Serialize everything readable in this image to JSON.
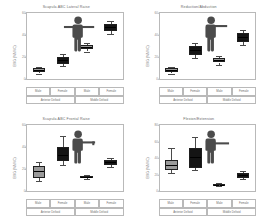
{
  "figure": {
    "background": "#ffffff",
    "box_fill_male": "#9a9a9a",
    "box_fill_female": "#141414",
    "axis_color": "#b9b9b9"
  },
  "panels": [
    {
      "id": "panel-scapula-lateral-raise",
      "title": "Scapula ABC Lateral Raise",
      "figure_icon": "standing-figure-arm-lateral-icon",
      "chart_data": {
        "type": "bar",
        "subtype": "boxplot",
        "title": "Scapula ABC Lateral Raise",
        "xlabel": "",
        "ylabel": "EMG (%MVC)",
        "ylim": [
          0,
          60
        ],
        "yticks": [
          0,
          20,
          40,
          60
        ],
        "ytick_labels": [
          "0",
          "20",
          "40",
          "60"
        ],
        "grid": false,
        "legend": "none",
        "categories": [
          "Male",
          "Female",
          "Male",
          "Female"
        ],
        "groups": [
          "Anterior Deltoid",
          "Middle Deltoid"
        ],
        "series": [
          {
            "name": "boxes",
            "boxes": [
              {
                "label": "Male",
                "group": "Anterior Deltoid",
                "q1": 6,
                "median": 8,
                "q3": 10,
                "whisker_low": 5,
                "whisker_high": 11,
                "fill": "#9a9a9a"
              },
              {
                "label": "Female",
                "group": "Anterior Deltoid",
                "q1": 14,
                "median": 17,
                "q3": 20,
                "whisker_low": 12,
                "whisker_high": 23,
                "fill": "#141414"
              },
              {
                "label": "Male",
                "group": "Middle Deltoid",
                "q1": 27,
                "median": 29,
                "q3": 31,
                "whisker_low": 25,
                "whisker_high": 33,
                "fill": "#9a9a9a"
              },
              {
                "label": "Female",
                "group": "Middle Deltoid",
                "q1": 44,
                "median": 47,
                "q3": 50,
                "whisker_low": 41,
                "whisker_high": 53,
                "fill": "#141414"
              }
            ]
          }
        ]
      }
    },
    {
      "id": "panel-reduction-abduction",
      "title": "Reduction/Abduction",
      "figure_icon": "standing-figure-arm-abduction-icon",
      "chart_data": {
        "type": "bar",
        "subtype": "boxplot",
        "title": "Reduction/Abduction",
        "xlabel": "",
        "ylabel": "EMG (%MVC)",
        "ylim": [
          0,
          60
        ],
        "yticks": [
          0,
          20,
          40,
          60
        ],
        "ytick_labels": [
          "0",
          "20",
          "40",
          "60"
        ],
        "grid": false,
        "legend": "none",
        "categories": [
          "Male",
          "Female",
          "Male",
          "Female"
        ],
        "groups": [
          "Anterior Deltoid",
          "Middle Deltoid"
        ],
        "series": [
          {
            "name": "boxes",
            "boxes": [
              {
                "label": "Male",
                "group": "Anterior Deltoid",
                "q1": 6,
                "median": 8,
                "q3": 10,
                "whisker_low": 5,
                "whisker_high": 11,
                "fill": "#9a9a9a"
              },
              {
                "label": "Female",
                "group": "Anterior Deltoid",
                "q1": 22,
                "median": 26,
                "q3": 30,
                "whisker_low": 19,
                "whisker_high": 33,
                "fill": "#141414"
              },
              {
                "label": "Male",
                "group": "Middle Deltoid",
                "q1": 15,
                "median": 17,
                "q3": 19,
                "whisker_low": 13,
                "whisker_high": 21,
                "fill": "#9a9a9a"
              },
              {
                "label": "Female",
                "group": "Middle Deltoid",
                "q1": 34,
                "median": 38,
                "q3": 42,
                "whisker_low": 31,
                "whisker_high": 45,
                "fill": "#141414"
              }
            ]
          }
        ]
      }
    },
    {
      "id": "panel-scapula-frontal-raise",
      "title": "Scapula ABC  Frontal Raise",
      "figure_icon": "standing-figure-arm-frontal-icon",
      "chart_data": {
        "type": "bar",
        "subtype": "boxplot",
        "title": "Scapula ABC  Frontal Raise",
        "xlabel": "",
        "ylabel": "EMG (%MVC)",
        "ylim": [
          0,
          60
        ],
        "yticks": [
          0,
          20,
          40,
          60
        ],
        "ytick_labels": [
          "0",
          "20",
          "40",
          "60"
        ],
        "grid": false,
        "legend": "none",
        "categories": [
          "Male",
          "Female",
          "Male",
          "Female"
        ],
        "groups": [
          "Anterior Deltoid",
          "Middle Deltoid"
        ],
        "series": [
          {
            "name": "boxes",
            "boxes": [
              {
                "label": "Male",
                "group": "Anterior Deltoid",
                "q1": 12,
                "median": 18,
                "q3": 23,
                "whisker_low": 9,
                "whisker_high": 26,
                "fill": "#9a9a9a"
              },
              {
                "label": "Female",
                "group": "Anterior Deltoid",
                "q1": 27,
                "median": 33,
                "q3": 40,
                "whisker_low": 24,
                "whisker_high": 50,
                "fill": "#141414"
              },
              {
                "label": "Male",
                "group": "Middle Deltoid",
                "q1": 12,
                "median": 13,
                "q3": 14,
                "whisker_low": 11,
                "whisker_high": 15,
                "fill": "#9a9a9a"
              },
              {
                "label": "Female",
                "group": "Middle Deltoid",
                "q1": 24,
                "median": 26,
                "q3": 28,
                "whisker_low": 22,
                "whisker_high": 30,
                "fill": "#141414"
              }
            ]
          }
        ]
      }
    },
    {
      "id": "panel-flexion-extension",
      "title": "Flexion/Extension",
      "figure_icon": "standing-figure-arm-flexion-icon",
      "chart_data": {
        "type": "bar",
        "subtype": "boxplot",
        "title": "Flexion/Extension",
        "xlabel": "",
        "ylabel": "EMG (%MVC)",
        "ylim": [
          0,
          80
        ],
        "yticks": [
          0,
          20,
          40,
          60,
          80
        ],
        "ytick_labels": [
          "0",
          "20",
          "40",
          "60",
          "80"
        ],
        "grid": false,
        "legend": "none",
        "categories": [
          "Male",
          "Female",
          "Male",
          "Female"
        ],
        "groups": [
          "Anterior Deltoid",
          "Middle Deltoid"
        ],
        "series": [
          {
            "name": "boxes",
            "boxes": [
              {
                "label": "Male",
                "group": "Anterior Deltoid",
                "q1": 26,
                "median": 32,
                "q3": 38,
                "whisker_low": 22,
                "whisker_high": 52,
                "fill": "#9a9a9a"
              },
              {
                "label": "Female",
                "group": "Anterior Deltoid",
                "q1": 28,
                "median": 42,
                "q3": 52,
                "whisker_low": 25,
                "whisker_high": 66,
                "fill": "#141414"
              },
              {
                "label": "Male",
                "group": "Middle Deltoid",
                "q1": 7,
                "median": 8,
                "q3": 9,
                "whisker_low": 6,
                "whisker_high": 10,
                "fill": "#9a9a9a"
              },
              {
                "label": "Female",
                "group": "Middle Deltoid",
                "q1": 16,
                "median": 19,
                "q3": 22,
                "whisker_low": 14,
                "whisker_high": 24,
                "fill": "#141414"
              }
            ]
          }
        ]
      }
    }
  ]
}
